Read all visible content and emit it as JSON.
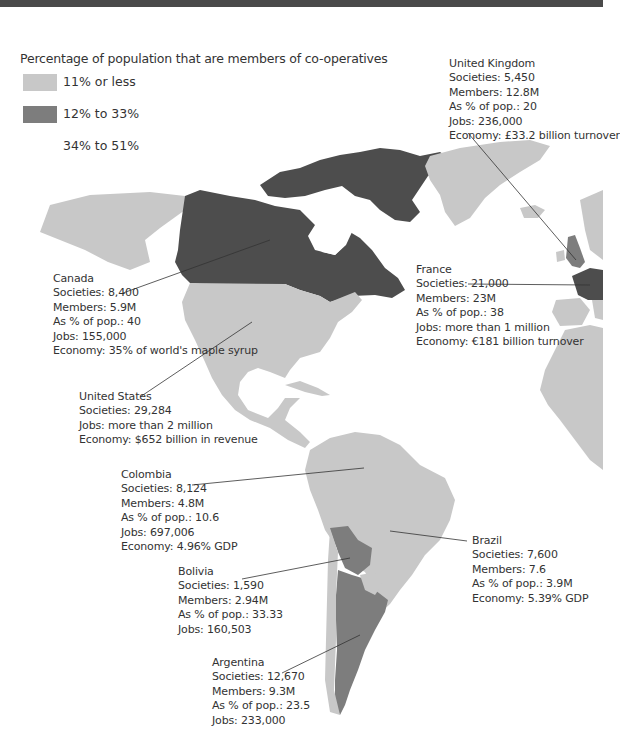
{
  "colors": {
    "topbar": "#4a4a4a",
    "low": "#c8c8c8",
    "mid": "#7d7d7d",
    "high": "#4d4d4d",
    "background": "#ffffff"
  },
  "legend": {
    "title": "Percentage of population that are members of co-operatives",
    "items": [
      {
        "label": "11% or less",
        "color": "#c8c8c8"
      },
      {
        "label": "12% to 33%",
        "color": "#7d7d7d"
      },
      {
        "label": "34% to 51%",
        "color": "#ffffff"
      }
    ]
  },
  "callouts": {
    "uk": {
      "name": "United Kingdom",
      "lines": [
        "Societies: 5,450",
        "Members: 12.8M",
        "As % of pop.: 20",
        "Jobs: 236,000",
        "Economy: £33.2 billion turnover"
      ]
    },
    "canada": {
      "name": "Canada",
      "lines": [
        "Societies: 8,400",
        "Members: 5.9M",
        "As % of pop.: 40",
        "Jobs: 155,000",
        "Economy: 35% of world's maple syrup"
      ]
    },
    "france": {
      "name": "France",
      "lines": [
        "Societies: 21,000",
        "Members: 23M",
        "As % of pop.: 38",
        "Jobs: more than 1 million",
        "Economy: €181 billion turnover"
      ]
    },
    "usa": {
      "name": "United States",
      "lines": [
        "Societies: 29,284",
        "Jobs: more than 2 million",
        "Economy: $652 billion in revenue"
      ]
    },
    "colombia": {
      "name": "Colombia",
      "lines": [
        "Societies: 8,124",
        "Members: 4.8M",
        "As % of pop.: 10.6",
        "Jobs: 697,006",
        "Economy: 4.96% GDP"
      ]
    },
    "brazil": {
      "name": "Brazil",
      "lines": [
        "Societies: 7,600",
        "Members: 7.6",
        "As % of pop.: 3.9M",
        "Economy: 5.39% GDP"
      ]
    },
    "bolivia": {
      "name": "Bolivia",
      "lines": [
        "Societies: 1,590",
        "Members: 2.94M",
        "As % of pop.: 33.33",
        "Jobs: 160,503"
      ]
    },
    "argentina": {
      "name": "Argentina",
      "lines": [
        "Societies: 12,670",
        "Members: 9.3M",
        "As % of pop.: 23.5",
        "Jobs: 233,000"
      ]
    }
  }
}
